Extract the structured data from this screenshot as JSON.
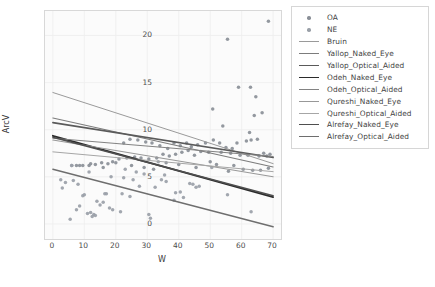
{
  "figure": {
    "background": "#ffffff",
    "plot_background": "#fbfbfb",
    "frame_color": "#d8d8d8"
  },
  "axes": {
    "xlabel": "W",
    "ylabel": "ArcV",
    "xticks": [
      "0",
      "10",
      "20",
      "30",
      "40",
      "50",
      "60",
      "70"
    ],
    "yticks": [
      "0",
      "5",
      "10",
      "15",
      "20"
    ]
  },
  "legend": {
    "border_color": "#d6d6d6",
    "entries": [
      {
        "label": "OA",
        "type": "marker",
        "color": "#8a8f97"
      },
      {
        "label": "NE",
        "type": "marker",
        "color": "#9aa0a8"
      },
      {
        "label": "Bruin",
        "type": "line",
        "color": "#9a9a9a",
        "width": 1.0
      },
      {
        "label": "Yallop_Naked_Eye",
        "type": "line",
        "color": "#7c7c7c",
        "width": 1.1
      },
      {
        "label": "Yallop_Optical_Aided",
        "type": "line",
        "color": "#5a5a5a",
        "width": 1.6
      },
      {
        "label": "Odeh_Naked_Eye",
        "type": "line",
        "color": "#2b2b2b",
        "width": 1.9
      },
      {
        "label": "Odeh_Optical_Aided",
        "type": "line",
        "color": "#838383",
        "width": 1.1
      },
      {
        "label": "Qureshi_Naked_Eye",
        "type": "line",
        "color": "#989898",
        "width": 1.1
      },
      {
        "label": "Qureshi_Optical_Aided",
        "type": "line",
        "color": "#a6a6a6",
        "width": 1.0
      },
      {
        "label": "Alrefay_Naked_Eye",
        "type": "line",
        "color": "#4f4f4f",
        "width": 1.5
      },
      {
        "label": "Alrefay_Optical_Aided",
        "type": "line",
        "color": "#6e6e6e",
        "width": 1.4
      }
    ]
  },
  "chart_data": {
    "type": "scatter",
    "title": "",
    "xlabel": "W",
    "ylabel": "ArcV",
    "xlim": [
      -2.5,
      72.5
    ],
    "ylim": [
      -1.6,
      22.6
    ],
    "grid": true,
    "legend_position": "right-outside",
    "series": [
      {
        "name": "OA",
        "type": "scatter",
        "color": "#8a8f97",
        "marker": "circle",
        "points": [
          [
            55.5,
            19.6
          ],
          [
            68.5,
            21.5
          ],
          [
            62.8,
            14.5
          ],
          [
            59.0,
            14.5
          ],
          [
            50.8,
            12.2
          ],
          [
            64.5,
            13.5
          ],
          [
            64.0,
            11.5
          ],
          [
            66.5,
            11.8
          ],
          [
            54.0,
            10.4
          ],
          [
            62.5,
            9.7
          ],
          [
            65.0,
            9.0
          ],
          [
            63.0,
            8.9
          ],
          [
            61.5,
            8.8
          ],
          [
            58.5,
            8.6
          ],
          [
            57.0,
            8.0
          ],
          [
            55.0,
            8.1
          ],
          [
            53.0,
            8.6
          ],
          [
            51.0,
            8.9
          ],
          [
            48.5,
            8.6
          ],
          [
            46.0,
            8.4
          ],
          [
            44.0,
            8.2
          ],
          [
            42.5,
            8.6
          ],
          [
            40.5,
            8.3
          ],
          [
            38.5,
            8.6
          ],
          [
            36.5,
            8.0
          ],
          [
            34.0,
            8.3
          ],
          [
            31.5,
            8.6
          ],
          [
            29.5,
            8.7
          ],
          [
            27.0,
            8.9
          ],
          [
            24.5,
            9.0
          ],
          [
            22.5,
            8.6
          ],
          [
            53.5,
            7.6
          ],
          [
            56.5,
            7.5
          ],
          [
            59.5,
            7.3
          ],
          [
            62.0,
            7.3
          ],
          [
            65.5,
            7.2
          ],
          [
            68.0,
            7.2
          ],
          [
            67.0,
            7.5
          ],
          [
            69.0,
            7.4
          ],
          [
            49.5,
            7.6
          ],
          [
            47.0,
            7.7
          ],
          [
            45.0,
            7.3
          ],
          [
            43.0,
            7.8
          ],
          [
            41.0,
            7.6
          ],
          [
            39.0,
            7.4
          ],
          [
            37.0,
            7.2
          ],
          [
            35.0,
            7.4
          ],
          [
            33.0,
            7.0
          ],
          [
            30.5,
            6.9
          ],
          [
            28.0,
            7.0
          ],
          [
            26.0,
            7.1
          ],
          [
            23.5,
            7.0
          ],
          [
            21.0,
            6.9
          ],
          [
            19.0,
            6.6
          ],
          [
            17.5,
            6.4
          ],
          [
            15.5,
            6.5
          ],
          [
            13.5,
            6.3
          ],
          [
            11.5,
            6.2
          ],
          [
            9.5,
            6.2
          ],
          [
            7.5,
            6.2
          ],
          [
            50.0,
            6.6
          ],
          [
            52.0,
            6.3
          ],
          [
            57.5,
            6.2
          ],
          [
            60.5,
            5.8
          ],
          [
            63.5,
            5.7
          ],
          [
            66.0,
            5.7
          ],
          [
            68.5,
            5.9
          ],
          [
            55.8,
            5.6
          ],
          [
            45.5,
            6.0
          ],
          [
            40.0,
            6.3
          ],
          [
            36.0,
            6.5
          ],
          [
            32.0,
            5.8
          ],
          [
            29.0,
            6.0
          ],
          [
            25.0,
            6.2
          ],
          [
            20.0,
            6.5
          ],
          [
            16.0,
            6.0
          ],
          [
            12.0,
            6.4
          ],
          [
            8.5,
            6.2
          ],
          [
            6.0,
            6.2
          ]
        ]
      },
      {
        "name": "NE",
        "type": "scatter",
        "color": "#9aa0a8",
        "marker": "circle",
        "points": [
          [
            2.5,
            4.7
          ],
          [
            4.0,
            4.4
          ],
          [
            3.0,
            3.8
          ],
          [
            6.5,
            4.6
          ],
          [
            8.0,
            4.2
          ],
          [
            9.5,
            3.0
          ],
          [
            5.5,
            0.5
          ],
          [
            7.5,
            1.5
          ],
          [
            8.5,
            1.9
          ],
          [
            11.0,
            1.1
          ],
          [
            12.0,
            1.2
          ],
          [
            12.5,
            0.8
          ],
          [
            13.0,
            1.0
          ],
          [
            13.5,
            0.9
          ],
          [
            14.0,
            2.4
          ],
          [
            15.0,
            2.0
          ],
          [
            16.0,
            2.3
          ],
          [
            16.5,
            3.2
          ],
          [
            17.0,
            3.2
          ],
          [
            18.0,
            1.7
          ],
          [
            19.0,
            1.5
          ],
          [
            21.5,
            1.3
          ],
          [
            22.0,
            3.2
          ],
          [
            22.5,
            4.9
          ],
          [
            24.5,
            2.9
          ],
          [
            25.5,
            4.7
          ],
          [
            31.0,
            0.6
          ],
          [
            30.5,
            1.0
          ],
          [
            32.5,
            3.9
          ],
          [
            34.5,
            4.7
          ],
          [
            36.0,
            4.5
          ],
          [
            38.5,
            2.5
          ],
          [
            39.0,
            3.3
          ],
          [
            40.5,
            3.4
          ],
          [
            43.5,
            4.3
          ],
          [
            44.5,
            4.2
          ],
          [
            45.5,
            3.9
          ],
          [
            46.5,
            4.0
          ],
          [
            41.5,
            2.8
          ],
          [
            55.5,
            3.1
          ],
          [
            63.0,
            1.3
          ],
          [
            26.5,
            5.5
          ],
          [
            11.5,
            5.5
          ],
          [
            10.0,
            3.1
          ],
          [
            6.0,
            6.2
          ],
          [
            18.5,
            5.0
          ],
          [
            27.5,
            4.0
          ],
          [
            35.5,
            5.2
          ],
          [
            50.5,
            6.0
          ],
          [
            29.0,
            5.3
          ],
          [
            23.0,
            5.8
          ],
          [
            33.5,
            6.6
          ]
        ]
      }
    ],
    "regression_lines": [
      {
        "name": "Bruin",
        "color": "#9a9a9a",
        "width": 1.0,
        "x0": 0,
        "y0": 13.95,
        "x1": 70,
        "y1": 6.4
      },
      {
        "name": "Yallop_Naked_Eye",
        "color": "#7c7c7c",
        "width": 1.1,
        "x0": 0,
        "y0": 11.25,
        "x1": 70,
        "y1": 6.05
      },
      {
        "name": "Yallop_Optical_Aided",
        "color": "#5a5a5a",
        "width": 1.6,
        "x0": 0,
        "y0": 10.75,
        "x1": 70,
        "y1": 7.05
      },
      {
        "name": "Odeh_Naked_Eye",
        "color": "#2b2b2b",
        "width": 1.9,
        "x0": 0,
        "y0": 9.35,
        "x1": 70,
        "y1": 2.85
      },
      {
        "name": "Odeh_Optical_Aided",
        "color": "#838383",
        "width": 1.1,
        "x0": 0,
        "y0": 9.1,
        "x1": 70,
        "y1": 7.15
      },
      {
        "name": "Qureshi_Naked_Eye",
        "color": "#989898",
        "width": 1.1,
        "x0": 0,
        "y0": 8.9,
        "x1": 70,
        "y1": 5.0
      },
      {
        "name": "Qureshi_Optical_Aided",
        "color": "#a6a6a6",
        "width": 1.0,
        "x0": 0,
        "y0": 7.65,
        "x1": 70,
        "y1": 5.55
      },
      {
        "name": "Alrefay_Naked_Eye",
        "color": "#4f4f4f",
        "width": 1.5,
        "x0": 0,
        "y0": 9.2,
        "x1": 70,
        "y1": 3.0
      },
      {
        "name": "Alrefay_Optical_Aided",
        "color": "#6e6e6e",
        "width": 1.4,
        "x0": 0,
        "y0": 5.8,
        "x1": 70,
        "y1": -0.3
      }
    ]
  }
}
